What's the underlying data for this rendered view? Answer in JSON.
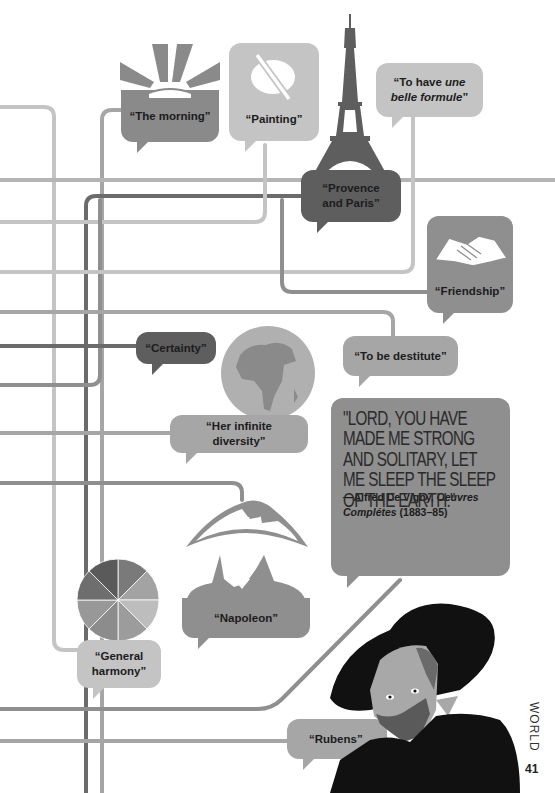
{
  "colors": {
    "light_gray": "#c4c4c4",
    "mid_gray": "#a6a6a6",
    "gray": "#8f8f8f",
    "dark_gray": "#6b6b6b",
    "near_black": "#141414"
  },
  "bubbles": {
    "morning": "“The morning”",
    "painting": "“Painting”",
    "belle_formule_1": "“To have ",
    "belle_formule_italic_1": "une",
    "belle_formule_italic_2": "belle formule",
    "belle_formule_end": "”",
    "provence_1": "“Provence",
    "provence_2": "and Paris”",
    "friendship": "“Friendship”",
    "certainty": "“Certainty”",
    "destitute": "“To be destitute”",
    "diversity": "“Her infinite diversity”",
    "napoleon": "“Napoleon”",
    "harmony_1": "“General",
    "harmony_2": "harmony”",
    "rubens": "“Rubens”"
  },
  "quote": {
    "text": "\"LORD, YOU HAVE MADE ME STRONG AND SOLITARY, LET ME SLEEP THE SLEEP OF THE EARTH.\"",
    "attribution_prefix": "—Alfred De Vigny, ",
    "attribution_work_1": "Oeuvres",
    "attribution_work_2": "Complétes",
    "attribution_years": " (1883–85)"
  },
  "page": {
    "section": "WORLD",
    "number": "41"
  }
}
